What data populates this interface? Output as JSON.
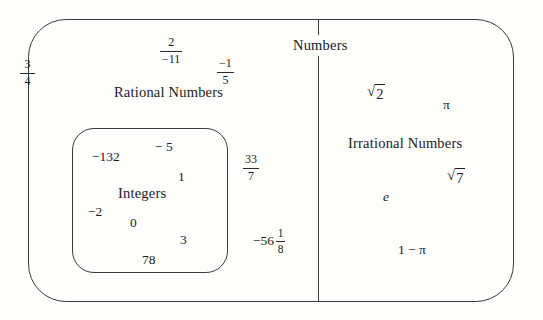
{
  "diagram": {
    "title": "Numbers",
    "outer_set_label": "Rational Numbers",
    "inner_set_label": "Integers",
    "right_set_label": "Irrational Numbers",
    "stroke_color": "#3a3a3a",
    "text_color": "#1c1c1c",
    "background": "#fdfdfc"
  },
  "rational_numbers": {
    "three_fourths": {
      "numerator": "3",
      "denominator": "4"
    },
    "two_over_neg_eleven": {
      "numerator": "2",
      "denominator": "−11"
    },
    "neg_one_fifth": {
      "numerator": "−1",
      "denominator": "5"
    },
    "thirty_three_sevenths": {
      "numerator": "33",
      "denominator": "7"
    },
    "neg_fifty_six_and_one_eighth": {
      "whole": "−56",
      "numerator": "1",
      "denominator": "8"
    }
  },
  "integers": {
    "values": [
      "−132",
      "− 5",
      "1",
      "−2",
      "0",
      "3",
      "78"
    ]
  },
  "irrational_numbers": {
    "sqrt_two": {
      "sign": "√",
      "radicand": "2"
    },
    "pi": "π",
    "e": "e",
    "sqrt_seven": {
      "sign": "√",
      "radicand": "7"
    },
    "one_minus_pi": "1 − π"
  }
}
